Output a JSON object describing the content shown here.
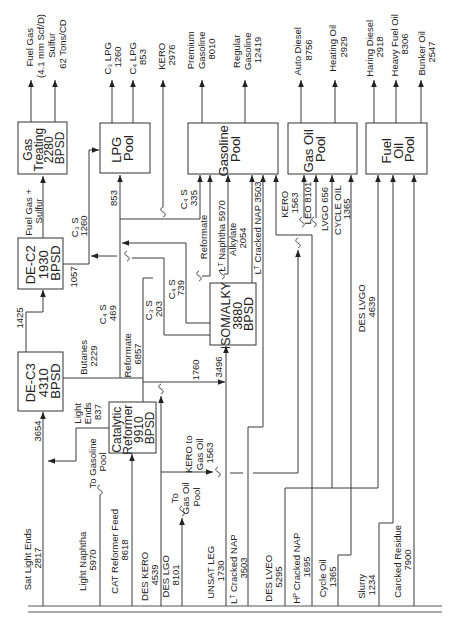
{
  "colors": {
    "line": "#3a3a3a",
    "text": "#222222",
    "background": "#ffffff"
  },
  "units": {
    "gas_treating": {
      "lines": [
        "Gas",
        "Treating",
        "2280",
        "BPSD"
      ]
    },
    "lpg_pool": {
      "lines": [
        "LPG",
        "Pool"
      ]
    },
    "gasoline_pool": {
      "lines": [
        "Gasoline",
        "Pool"
      ]
    },
    "gas_oil_pool": {
      "lines": [
        "Gas Oil",
        "Pool"
      ]
    },
    "fuel_oil_pool": {
      "lines": [
        "Fuel",
        "Oil",
        "Pool"
      ]
    },
    "de_c2": {
      "lines": [
        "DE-C2",
        "1930",
        "BPSD"
      ]
    },
    "de_c3": {
      "lines": [
        "DE-C3",
        "4310",
        "BPSD"
      ]
    },
    "cat_reformer": {
      "lines": [
        "Catalytic",
        "Reformer",
        "9910",
        "BPSD"
      ]
    },
    "isom_alky": {
      "lines": [
        "ISOM/ALKY",
        "3880",
        "BPSD"
      ]
    }
  },
  "products": {
    "fuel_gas": {
      "lines": [
        "Fuel Gas",
        "(4.1 mm Scf/D)"
      ]
    },
    "sulfur": {
      "lines": [
        "Sulfur",
        "62 Tons/CD"
      ]
    },
    "c3_lpg": {
      "lines": [
        "C₃ LPG",
        "1260"
      ]
    },
    "c4_lpg": {
      "lines": [
        "C₄ LPG",
        "853"
      ]
    },
    "kero": {
      "lines": [
        "KERO",
        "2976"
      ]
    },
    "premium_gasoline": {
      "lines": [
        "Premium",
        "Gasoline",
        "8010"
      ]
    },
    "regular_gasoline": {
      "lines": [
        "Regular",
        "Gasoline",
        "12419"
      ]
    },
    "auto_diesel": {
      "lines": [
        "Auto Diesel",
        "8756"
      ]
    },
    "heating_oil": {
      "lines": [
        "Heating Oil",
        "2929"
      ]
    },
    "haring_diesel": {
      "lines": [
        "Haring Diesel",
        "2918"
      ]
    },
    "heavy_fuel_oil": {
      "lines": [
        "Heavy Fuel Oil",
        "8306"
      ]
    },
    "bunker_oil": {
      "lines": [
        "Bunker Oil",
        "2547"
      ]
    }
  },
  "feeds": {
    "sat_light_ends": {
      "lines": [
        "Sat Light Ends",
        "2817"
      ]
    },
    "light_naphtha": {
      "lines": [
        "Light Naphtha",
        "5970"
      ]
    },
    "cat_reformer_feed": {
      "lines": [
        "CAT Reformer Feed",
        "8618"
      ]
    },
    "des_kero": {
      "lines": [
        "DES KERO",
        "4539"
      ]
    },
    "des_lgo": {
      "lines": [
        "DES LGO",
        "8101"
      ]
    },
    "unsat_leg": {
      "lines": [
        "UNSAT LEG",
        "1730"
      ]
    },
    "lt_cracked_nap": {
      "lines": [
        "Lᵀ Cracked NAP",
        "3503"
      ]
    },
    "des_lveo": {
      "lines": [
        "DES LVEO",
        "5295"
      ]
    },
    "hp_cracked_nap": {
      "lines": [
        "Hᴾ Cracked NAP",
        "1695"
      ]
    },
    "cycle_oil": {
      "lines": [
        "Cycle Oil",
        "1365"
      ]
    },
    "slurry": {
      "lines": [
        "Slurry",
        "1234"
      ]
    },
    "carcked_residue": {
      "lines": [
        "Carcked Residue",
        "7900"
      ]
    }
  },
  "streams": {
    "de_c3_feed": {
      "lines": [
        "3654"
      ]
    },
    "light_ends": {
      "lines": [
        "Light",
        "Ends",
        "837"
      ]
    },
    "to_gasoline_pool": {
      "lines": [
        "To Gasoline",
        "Pool"
      ]
    },
    "de_c3_to_de_c2": {
      "lines": [
        "1425"
      ]
    },
    "butanes": {
      "lines": [
        "Butanes",
        "2229"
      ]
    },
    "reformate_out": {
      "lines": [
        "Reformate",
        "6857"
      ]
    },
    "de_c2_out": {
      "lines": [
        "1057"
      ]
    },
    "fuel_gas_sulfur": {
      "lines": [
        "Fuel Gas +",
        "Sulfur"
      ]
    },
    "c3s_1260": {
      "lines": [
        "C₃ S",
        "1260"
      ]
    },
    "c4s_469": {
      "lines": [
        "C₄ S",
        "469"
      ]
    },
    "lpg_853": {
      "lines": [
        "853"
      ]
    },
    "c4s_335": {
      "lines": [
        "C₄ S",
        "335"
      ]
    },
    "reformate_to_gasoline": {
      "lines": [
        "Reformate"
      ]
    },
    "lt_naphtha": {
      "lines": [
        "Lᵀ Naphtha 5970"
      ]
    },
    "alkylate": {
      "lines": [
        "Alkylate",
        "2054"
      ]
    },
    "lt_cracked_nap_3503": {
      "lines": [
        "Lᵀ Cracked NAP 3503"
      ]
    },
    "c3s_203": {
      "lines": [
        "C₃ S",
        "203"
      ]
    },
    "c4s_739": {
      "lines": [
        "C₄ S",
        "739"
      ]
    },
    "isom_feed_1760": {
      "lines": [
        "1760"
      ]
    },
    "isom_feed_3496": {
      "lines": [
        "3496"
      ]
    },
    "to_gas_oil_pool": {
      "lines": [
        "To",
        "Gas Oil",
        "Pool"
      ]
    },
    "kero_to_gas_oil": {
      "lines": [
        "KERO to",
        "Gas Oil",
        "1563"
      ]
    },
    "kero_1563": {
      "lines": [
        "KERO",
        "1563"
      ]
    },
    "leo_8101": {
      "lines": [
        "LEO 8101"
      ]
    },
    "lvgo_656": {
      "lines": [
        "LVGO 656"
      ]
    },
    "cycle_oil_1365": {
      "lines": [
        "CYCLE OIL",
        "1365"
      ]
    },
    "des_lvgo": {
      "lines": [
        "DES LVGO",
        "4639"
      ]
    }
  }
}
